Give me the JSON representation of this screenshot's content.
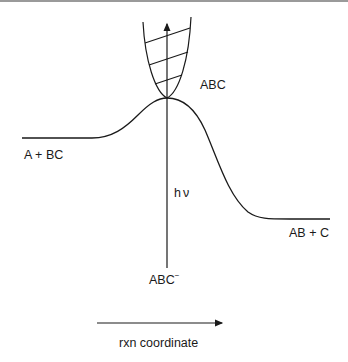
{
  "diagram": {
    "type": "potential-energy-curve",
    "labels": {
      "reactants": "A + BC",
      "products": "AB + C",
      "transition_state": "ABC",
      "anion": "ABC",
      "anion_charge": "−",
      "photon": "hν",
      "axis": "rxn coordinate"
    },
    "colors": {
      "ink": "#1a1a1a",
      "frame_line": "#9a9a9a"
    }
  }
}
